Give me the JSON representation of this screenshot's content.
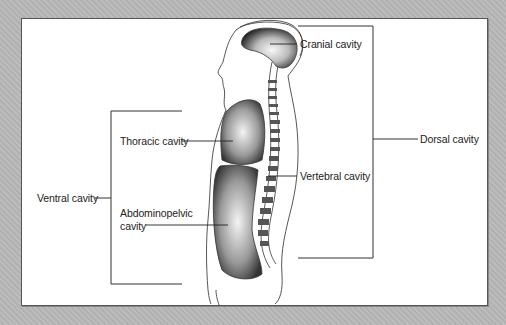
{
  "figure": {
    "labels": {
      "cranial": "Cranial cavity",
      "dorsal": "Dorsal cavity",
      "thoracic": "Thoracic cavity",
      "vertebral": "Vertebral cavity",
      "ventral": "Ventral cavity",
      "abdominopelvic_line1": "Abdominopelvic",
      "abdominopelvic_line2": "cavity"
    },
    "groups": [
      {
        "name": "Dorsal cavity",
        "members": [
          "Cranial cavity",
          "Vertebral cavity"
        ]
      },
      {
        "name": "Ventral cavity",
        "members": [
          "Thoracic cavity",
          "Abdominopelvic cavity"
        ]
      }
    ],
    "colors": {
      "background": "#b8b8b8",
      "panel": "#ffffff",
      "line": "#333333"
    }
  }
}
